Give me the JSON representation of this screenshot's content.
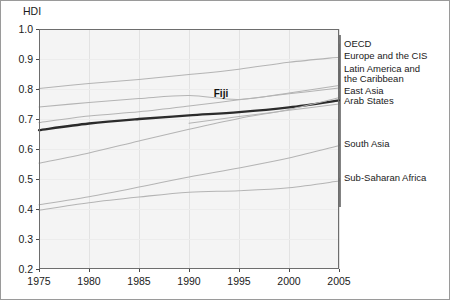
{
  "chart_data": {
    "type": "line",
    "title": "",
    "xlabel": "",
    "ylabel": "HDI",
    "xlim": [
      1975,
      2005
    ],
    "ylim": [
      0.2,
      1.0
    ],
    "grid": true,
    "legend_position": "right-of-plot-with-leader-lines",
    "x": [
      1975,
      1980,
      1985,
      1990,
      1995,
      2000,
      2005
    ],
    "xtick_labels": [
      "1975",
      "1980",
      "1985",
      "1990",
      "1995",
      "2000",
      "2005"
    ],
    "ytick_labels": [
      "0.2",
      "0.3",
      "0.4",
      "0.5",
      "0.6",
      "0.7",
      "0.8",
      "0.9",
      "1.0"
    ],
    "yticks": [
      0.2,
      0.3,
      0.4,
      0.5,
      0.6,
      0.7,
      0.8,
      0.9,
      1.0
    ],
    "series": [
      {
        "name": "OECD",
        "highlight": false,
        "x": [
          1975,
          1980,
          1985,
          1990,
          1995,
          2000,
          2005
        ],
        "values": [
          0.802,
          0.818,
          0.832,
          0.848,
          0.866,
          0.889,
          0.906
        ]
      },
      {
        "name": "Europe and the CIS",
        "highlight": false,
        "x": [
          1975,
          1980,
          1985,
          1990,
          1995,
          2000,
          2005
        ],
        "values": [
          0.74,
          0.755,
          0.768,
          0.778,
          0.765,
          0.787,
          0.812
        ]
      },
      {
        "name": "Latin America and the Caribbean",
        "highlight": false,
        "x": [
          1975,
          1980,
          1985,
          1990,
          1995,
          2000,
          2005
        ],
        "values": [
          0.688,
          0.71,
          0.724,
          0.743,
          0.764,
          0.784,
          0.803
        ]
      },
      {
        "name": "Fiji",
        "highlight": true,
        "x": [
          1975,
          1980,
          1985,
          1990,
          1995,
          2000,
          2005
        ],
        "values": [
          0.663,
          0.685,
          0.7,
          0.712,
          0.723,
          0.739,
          0.762
        ]
      },
      {
        "name": "East Asia",
        "highlight": false,
        "x": [
          1975,
          1980,
          1985,
          1990,
          1995,
          2000,
          2005
        ],
        "values": [
          0.553,
          0.587,
          0.627,
          0.666,
          0.702,
          0.732,
          0.771
        ]
      },
      {
        "name": "Arab States",
        "highlight": false,
        "x": [
          1990,
          1995,
          2000,
          2005
        ],
        "values": [
          0.686,
          0.708,
          0.729,
          0.75
        ]
      },
      {
        "name": "South Asia",
        "highlight": false,
        "x": [
          1975,
          1980,
          1985,
          1990,
          1995,
          2000,
          2005
        ],
        "values": [
          0.414,
          0.441,
          0.473,
          0.507,
          0.537,
          0.57,
          0.611
        ]
      },
      {
        "name": "Sub-Saharan Africa",
        "highlight": false,
        "x": [
          1975,
          1980,
          1985,
          1990,
          1995,
          2000,
          2005
        ],
        "values": [
          0.396,
          0.421,
          0.44,
          0.456,
          0.461,
          0.471,
          0.493
        ]
      }
    ],
    "annotations": [
      {
        "text": "Fiji",
        "x": 1993.2,
        "y": 0.775,
        "bold": true
      }
    ],
    "legend_entries": [
      {
        "label": "OECD",
        "series": "OECD"
      },
      {
        "label": "Europe and the CIS",
        "series": "Europe and the CIS"
      },
      {
        "label": "Latin America and",
        "series": "Latin America and the Caribbean"
      },
      {
        "label": "the Caribbean",
        "series": "Latin America and the Caribbean"
      },
      {
        "label": "East Asia",
        "series": "East Asia"
      },
      {
        "label": "Arab States",
        "series": "Arab States"
      },
      {
        "label": "South Asia",
        "series": "South Asia"
      },
      {
        "label": "Sub-Saharan Africa",
        "series": "Sub-Saharan Africa"
      }
    ]
  },
  "colors": {
    "line_default": "#b4b4b4",
    "line_highlight": "#2b2b2b",
    "plot_background": "#f4f4f4",
    "frame": "#6d6d6d",
    "text": "#1a1a1a"
  }
}
